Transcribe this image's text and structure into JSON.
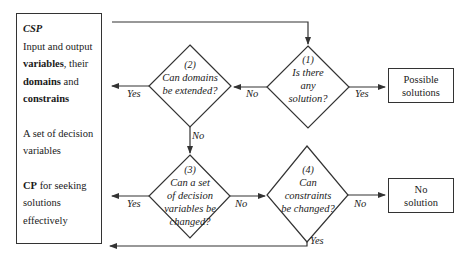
{
  "left_box": {
    "title": "CSP",
    "line1": "Input and output",
    "var_bold": "variables",
    "var_rest": ", their",
    "dom_bold": "domains",
    "dom_rest": " and",
    "cons_bold": "constrains",
    "dec_line1": "A set of decision",
    "dec_line2": "variables",
    "cp_bold": "CP",
    "cp_rest": " for seeking",
    "cp_line2": "solutions",
    "cp_line3": "effectively"
  },
  "decisions": [
    {
      "num": "(1)",
      "lines": [
        "Is there",
        "any",
        "solution?"
      ]
    },
    {
      "num": "(2)",
      "lines": [
        "Can domains",
        "be extended?"
      ]
    },
    {
      "num": "(3)",
      "lines": [
        "Can a set",
        "of decision",
        "variables be",
        "changed?"
      ]
    },
    {
      "num": "(4)",
      "lines": [
        "Can",
        "constraints",
        "be changed?"
      ]
    }
  ],
  "outcomes": {
    "possible": [
      "Possible",
      "solutions"
    ],
    "none": [
      "No",
      "solution"
    ]
  },
  "edge_labels": {
    "d1_no": "No",
    "d1_yes": "Yes",
    "d2_yes": "Yes",
    "d2_no": "No",
    "d3_yes": "Yes",
    "d3_no": "No",
    "d4_no": "No",
    "d4_yes": "Yes"
  },
  "colors": {
    "line": "#333333",
    "text": "#1a1a1a",
    "background": "#ffffff"
  }
}
